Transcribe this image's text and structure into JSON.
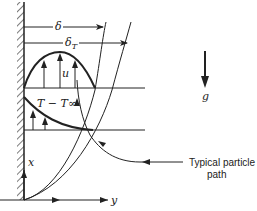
{
  "diagram": {
    "type": "natural-convection-boundary-layer",
    "labels": {
      "delta": "δ",
      "delta_t_main": "δ",
      "delta_t_sub": "T",
      "velocity": "u",
      "temperature": "T − T∞",
      "gravity": "g",
      "x_axis": "x",
      "y_axis": "y",
      "particle_path_line1": "Typical particle",
      "particle_path_line2": "path"
    },
    "colors": {
      "stroke": "#222222",
      "background": "#ffffff"
    }
  }
}
